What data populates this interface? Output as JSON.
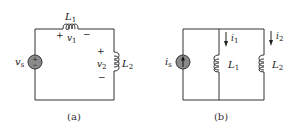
{
  "figure": {
    "panels": [
      {
        "id": "a",
        "caption": "(a)",
        "source": {
          "type": "voltage-source",
          "label": "v",
          "sub": "s",
          "plus": "+",
          "minus": "−"
        },
        "inductors": [
          {
            "name": "L",
            "sub": "1",
            "voltage": "v",
            "vsub": "1",
            "plus": "+",
            "minus": "−"
          },
          {
            "name": "L",
            "sub": "2",
            "voltage": "v",
            "vsub": "2",
            "plus": "+",
            "minus": "−"
          }
        ],
        "topology": "series"
      },
      {
        "id": "b",
        "caption": "(b)",
        "source": {
          "type": "current-source",
          "label": "i",
          "sub": "s"
        },
        "inductors": [
          {
            "name": "L",
            "sub": "1",
            "current": "i",
            "isub": "1"
          },
          {
            "name": "L",
            "sub": "2",
            "current": "i",
            "isub": "2"
          }
        ],
        "topology": "parallel"
      }
    ],
    "colors": {
      "wire": "#333333",
      "source_fill": "#8a8a8a",
      "background": "#ffffff"
    }
  }
}
